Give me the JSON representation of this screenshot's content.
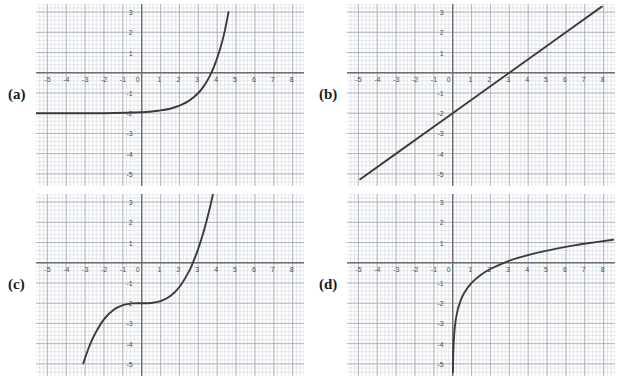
{
  "page": {
    "background": "#ffffff"
  },
  "style": {
    "minor_grid_color": "#ccd0d8",
    "major_grid_color": "#9aa0ac",
    "axis_color": "#6e6e6e",
    "curve_color": "#3b3b3b",
    "tick_label_color": "#4a4a4a",
    "panel_label_color": "#1b1b1b"
  },
  "axes": {
    "xlim": [
      -5.6,
      8.6
    ],
    "ylim": [
      -5.6,
      3.4
    ],
    "x_ticks": [
      "-5",
      "-4",
      "-3",
      "-2",
      "-1",
      "0",
      "1",
      "2",
      "3",
      "4",
      "5",
      "6",
      "7",
      "8"
    ],
    "y_ticks": [
      "3",
      "2",
      "1",
      "-1",
      "-2",
      "-3",
      "-4",
      "-5"
    ],
    "minor_step": 0.2,
    "major_step": 1,
    "grid": true
  },
  "panels": [
    {
      "label": "(a)",
      "name": "panel-a",
      "curve_name": "exponential-curve",
      "chart_data": {
        "type": "line",
        "title": "",
        "xlabel": "",
        "ylabel": "",
        "function": "y = e^(x-3) - 2",
        "xlim": [
          -5.6,
          8.6
        ],
        "ylim": [
          -5.6,
          3.4
        ],
        "x_ticks": [
          "-5",
          "-4",
          "-3",
          "-2",
          "-1",
          "0",
          "1",
          "2",
          "3",
          "4",
          "5",
          "6",
          "7",
          "8"
        ],
        "y_ticks": [
          "3",
          "2",
          "1",
          "-1",
          "-2",
          "-3",
          "-4",
          "-5"
        ],
        "horizontal_asymptote": -2,
        "x_intercept": 3,
        "y_intercept": -1.95,
        "x_domain_drawn": [
          -5.6,
          4.1
        ],
        "points": [
          {
            "x": -5.6,
            "y": -2.0
          },
          {
            "x": -4.0,
            "y": -2.0
          },
          {
            "x": -2.0,
            "y": -2.0
          },
          {
            "x": 0.0,
            "y": -1.95
          },
          {
            "x": 1.0,
            "y": -1.86
          },
          {
            "x": 1.5,
            "y": -1.78
          },
          {
            "x": 2.0,
            "y": -1.63
          },
          {
            "x": 2.5,
            "y": -1.39
          },
          {
            "x": 3.0,
            "y": -1.0
          },
          {
            "x": 3.3,
            "y": -0.65
          },
          {
            "x": 3.6,
            "y": -0.18
          },
          {
            "x": 3.9,
            "y": 0.46
          },
          {
            "x": 4.2,
            "y": 1.32
          },
          {
            "x": 4.4,
            "y": 2.06
          },
          {
            "x": 4.6,
            "y": 3.0
          }
        ]
      }
    },
    {
      "label": "(b)",
      "name": "panel-b",
      "curve_name": "linear-curve",
      "chart_data": {
        "type": "line",
        "title": "",
        "xlabel": "",
        "ylabel": "",
        "function": "y = (2/3)x - 2",
        "xlim": [
          -5.6,
          8.6
        ],
        "ylim": [
          -5.6,
          3.4
        ],
        "x_ticks": [
          "-5",
          "-4",
          "-3",
          "-2",
          "-1",
          "0",
          "1",
          "2",
          "3",
          "4",
          "5",
          "6",
          "7",
          "8"
        ],
        "y_ticks": [
          "3",
          "2",
          "1",
          "-1",
          "-2",
          "-3",
          "-4",
          "-5"
        ],
        "slope": 0.6667,
        "y_intercept": -2,
        "x_intercept": 3,
        "points": [
          {
            "x": -4.9,
            "y": -5.27
          },
          {
            "x": -3.0,
            "y": -4.0
          },
          {
            "x": 0.0,
            "y": -2.0
          },
          {
            "x": 3.0,
            "y": 0.0
          },
          {
            "x": 6.0,
            "y": 2.0
          },
          {
            "x": 7.9,
            "y": 3.27
          }
        ]
      }
    },
    {
      "label": "(c)",
      "name": "panel-c",
      "curve_name": "cubic-curve",
      "chart_data": {
        "type": "line",
        "title": "",
        "xlabel": "",
        "ylabel": "",
        "function": "y = 0.1x^3 - 2",
        "xlim": [
          -5.6,
          8.6
        ],
        "ylim": [
          -5.6,
          3.4
        ],
        "x_ticks": [
          "-5",
          "-4",
          "-3",
          "-2",
          "-1",
          "0",
          "1",
          "2",
          "3",
          "4",
          "5",
          "6",
          "7",
          "8"
        ],
        "y_ticks": [
          "3",
          "2",
          "1",
          "-1",
          "-2",
          "-3",
          "-4",
          "-5"
        ],
        "inflection_point": {
          "x": 0,
          "y": -2
        },
        "x_intercept": 2.71,
        "y_intercept": -2,
        "points": [
          {
            "x": -3.1,
            "y": -4.98
          },
          {
            "x": -2.8,
            "y": -4.19
          },
          {
            "x": -2.5,
            "y": -3.56
          },
          {
            "x": -2.0,
            "y": -2.8
          },
          {
            "x": -1.5,
            "y": -2.34
          },
          {
            "x": -1.0,
            "y": -2.1
          },
          {
            "x": -0.5,
            "y": -2.01
          },
          {
            "x": 0.0,
            "y": -2.0
          },
          {
            "x": 0.5,
            "y": -1.99
          },
          {
            "x": 1.0,
            "y": -1.9
          },
          {
            "x": 1.5,
            "y": -1.66
          },
          {
            "x": 2.0,
            "y": -1.2
          },
          {
            "x": 2.5,
            "y": -0.44
          },
          {
            "x": 2.71,
            "y": 0.0
          },
          {
            "x": 3.0,
            "y": 0.7
          },
          {
            "x": 3.3,
            "y": 1.59
          },
          {
            "x": 3.6,
            "y": 2.67
          },
          {
            "x": 3.78,
            "y": 3.4
          }
        ]
      }
    },
    {
      "label": "(d)",
      "name": "panel-d",
      "curve_name": "logarithmic-curve",
      "chart_data": {
        "type": "line",
        "title": "",
        "xlabel": "",
        "ylabel": "",
        "function": "y = ln(x) - 1",
        "xlim": [
          -5.6,
          8.6
        ],
        "ylim": [
          -5.6,
          3.4
        ],
        "x_ticks": [
          "-5",
          "-4",
          "-3",
          "-2",
          "-1",
          "0",
          "1",
          "2",
          "3",
          "4",
          "5",
          "6",
          "7",
          "8"
        ],
        "y_ticks": [
          "3",
          "2",
          "1",
          "-1",
          "-2",
          "-3",
          "-4",
          "-5"
        ],
        "vertical_asymptote": 0,
        "x_intercept": 2.718,
        "points": [
          {
            "x": 0.012,
            "y": -5.42
          },
          {
            "x": 0.02,
            "y": -4.91
          },
          {
            "x": 0.04,
            "y": -4.22
          },
          {
            "x": 0.08,
            "y": -3.53
          },
          {
            "x": 0.14,
            "y": -2.97
          },
          {
            "x": 0.25,
            "y": -2.39
          },
          {
            "x": 0.4,
            "y": -1.92
          },
          {
            "x": 0.6,
            "y": -1.51
          },
          {
            "x": 1.0,
            "y": -1.0
          },
          {
            "x": 1.5,
            "y": -0.59
          },
          {
            "x": 2.0,
            "y": -0.31
          },
          {
            "x": 2.718,
            "y": 0.0
          },
          {
            "x": 3.5,
            "y": 0.25
          },
          {
            "x": 4.5,
            "y": 0.5
          },
          {
            "x": 5.5,
            "y": 0.7
          },
          {
            "x": 6.5,
            "y": 0.87
          },
          {
            "x": 7.5,
            "y": 1.01
          },
          {
            "x": 8.5,
            "y": 1.14
          }
        ]
      }
    }
  ]
}
